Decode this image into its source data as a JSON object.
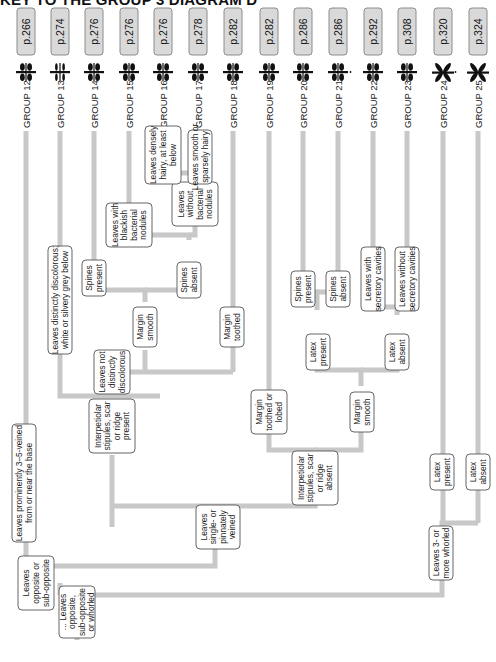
{
  "title": "KEY TO THE GROUP 3 DIAGRAM D",
  "groups": [
    {
      "label": "GROUP 12",
      "page": "p.266",
      "icon": "opposite-leaves-icon",
      "x": 26
    },
    {
      "label": "GROUP 13",
      "page": "p.274",
      "icon": "opposite-leaves-thin-icon",
      "x": 60
    },
    {
      "label": "GROUP 14",
      "page": "p.276",
      "icon": "opposite-leaves-stipule-icon",
      "x": 94
    },
    {
      "label": "GROUP 15",
      "page": "p.276",
      "icon": "opposite-leaves-icon",
      "x": 129
    },
    {
      "label": "GROUP 16",
      "page": "p.276",
      "icon": "opposite-leaves-icon",
      "x": 163
    },
    {
      "label": "GROUP 17",
      "page": "p.278",
      "icon": "opposite-leaves-icon",
      "x": 198
    },
    {
      "label": "GROUP 18",
      "page": "p.282",
      "icon": "opposite-leaves-icon",
      "x": 233
    },
    {
      "label": "GROUP 19",
      "page": "p.282",
      "icon": "opposite-leaves-icon",
      "x": 269
    },
    {
      "label": "GROUP 20",
      "page": "p.286",
      "icon": "opposite-leaves-stipule-icon",
      "x": 303
    },
    {
      "label": "GROUP 21",
      "page": "p.286",
      "icon": "opposite-leaves-latex-icon",
      "x": 338
    },
    {
      "label": "GROUP 22",
      "page": "p.292",
      "icon": "opposite-leaves-grey-icon",
      "x": 373
    },
    {
      "label": "GROUP 23",
      "page": "p.308",
      "icon": "opposite-leaves-icon",
      "x": 407
    },
    {
      "label": "GROUP 24",
      "page": "p.320",
      "icon": "whorled-leaves-latex-icon",
      "x": 443
    },
    {
      "label": "GROUP 25",
      "page": "p.324",
      "icon": "whorled-leaves-icon",
      "x": 478
    }
  ],
  "nodes": {
    "root": [
      "... Leaves",
      "opposite,",
      "sub-opposite",
      "or whorled"
    ],
    "opposite": [
      "Leaves",
      "opposite or",
      "sub-opposite"
    ],
    "whorled": [
      "Leaves 3- or",
      "more whorled"
    ],
    "veined_3_5": [
      "Leaves prominently 3–5-veined",
      "from or near the base"
    ],
    "single_pinnate": [
      "Leaves",
      "single- or",
      "pinnately",
      "veined"
    ],
    "stipules_present": [
      "Interpetiolar",
      "stipules, scar",
      "or ridge",
      "present"
    ],
    "stipules_absent": [
      "Interpetiolar",
      "stipules, scar",
      "or ridge",
      "absent"
    ],
    "discolorous": [
      "Leaves distinctly discolorous;",
      "white or silvery grey below"
    ],
    "not_discolorous": [
      "Leaves not",
      "distinctly",
      "discolorous"
    ],
    "margin_smooth_a": [
      "Margin",
      "smooth"
    ],
    "margin_toothed_a": [
      "Margin",
      "toothed"
    ],
    "spines_present_a": [
      "Spines",
      "present"
    ],
    "spines_absent_a": [
      "Spines",
      "absent"
    ],
    "bacterial_nodules": [
      "Leaves with",
      "blackish",
      "bacterial",
      "nodules"
    ],
    "no_bacterial_nodules": [
      "Leaves",
      "without",
      "bacterial",
      "nodules"
    ],
    "densely_hairy": [
      "Leaves densely",
      "hairy, at least",
      "below"
    ],
    "smooth_hairy": [
      "Leaves smooth or",
      "sparsely hairy"
    ],
    "margin_toothed_lobed": [
      "Margin",
      "toothed or",
      "lobed"
    ],
    "margin_smooth_b": [
      "Margin",
      "smooth"
    ],
    "latex_present_b": [
      "Latex",
      "present"
    ],
    "latex_absent_b": [
      "Latex",
      "absent"
    ],
    "spines_present_b": [
      "Spines",
      "present"
    ],
    "spines_absent_b": [
      "Spines",
      "absent"
    ],
    "secretory_with": [
      "Leaves with",
      "secretory cavities"
    ],
    "secretory_without": [
      "Leaves without",
      "secretory cavities"
    ],
    "latex_present_c": [
      "Latex",
      "present"
    ],
    "latex_absent_c": [
      "Latex",
      "absent"
    ]
  },
  "colors": {
    "connector": "#c8c8c8",
    "badge_fill": "#d9d9d9",
    "badge_stroke": "#8c8c8c",
    "node_stroke": "#555555",
    "text": "#111111"
  }
}
